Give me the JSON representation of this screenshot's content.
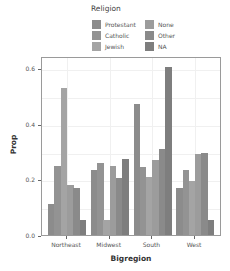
{
  "chart_data": {
    "type": "bar",
    "title": "",
    "xlabel": "Bigregion",
    "ylabel": "Prop",
    "ylim": [
      0,
      0.64
    ],
    "yticks": [
      "0.0",
      "0.2",
      "0.4",
      "0.6"
    ],
    "grid": true,
    "legend_position": "top",
    "legend_title": "Religion",
    "categories": [
      "Northeast",
      "Midwest",
      "South",
      "West"
    ],
    "series": [
      {
        "name": "Protestant",
        "color": "#8c8c8c",
        "values": [
          0.11,
          0.235,
          0.47,
          0.17
        ]
      },
      {
        "name": "Catholic",
        "color": "#939393",
        "values": [
          0.25,
          0.26,
          0.245,
          0.235
        ]
      },
      {
        "name": "Jewish",
        "color": "#a4a4a4",
        "values": [
          0.53,
          0.055,
          0.21,
          0.195
        ]
      },
      {
        "name": "None",
        "color": "#9c9c9c",
        "values": [
          0.18,
          0.25,
          0.27,
          0.29
        ]
      },
      {
        "name": "Other",
        "color": "#8a8a8a",
        "values": [
          0.17,
          0.205,
          0.31,
          0.295
        ]
      },
      {
        "name": "NA",
        "color": "#7e7e7e",
        "values": [
          0.055,
          0.275,
          0.605,
          0.055
        ]
      }
    ]
  }
}
